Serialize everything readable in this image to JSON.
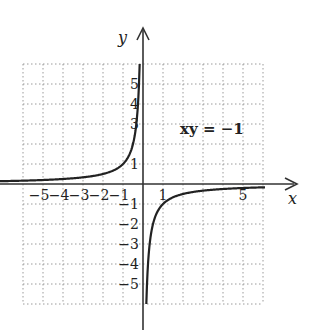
{
  "chart_data": {
    "type": "line",
    "title": "",
    "equation": "xy = −1",
    "function": "y = -1/x",
    "xlabel": "x",
    "ylabel": "y",
    "xlim": [
      -6,
      6
    ],
    "ylim": [
      -6,
      6
    ],
    "grid": true,
    "x_tick_labels": [
      "−5",
      "−4",
      "−3",
      "−2",
      "−1",
      "1",
      "5"
    ],
    "y_tick_labels": [
      "5",
      "4",
      "3",
      "1",
      "−1",
      "−2",
      "−3",
      "−4",
      "−5"
    ],
    "series": [
      {
        "name": "left branch (x<0)",
        "x": [
          -6,
          -5,
          -4,
          -3,
          -2,
          -1,
          -0.5,
          -0.25,
          -0.2
        ],
        "y": [
          0.167,
          0.2,
          0.25,
          0.333,
          0.5,
          1,
          2,
          4,
          5
        ]
      },
      {
        "name": "right branch (x>0)",
        "x": [
          0.17,
          0.2,
          0.25,
          0.5,
          1,
          2,
          3,
          4,
          5,
          6
        ],
        "y": [
          -6,
          -5,
          -4,
          -2,
          -1,
          -0.5,
          -0.333,
          -0.25,
          -0.2,
          -0.167
        ]
      }
    ]
  },
  "labels": {
    "x_axis": "x",
    "y_axis": "y",
    "equation": "xy = −1"
  }
}
